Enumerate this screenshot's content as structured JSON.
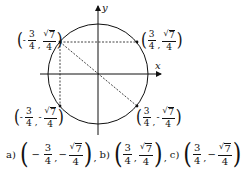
{
  "diagram": {
    "type": "unit-circle",
    "axes": {
      "x_label": "x",
      "y_label": "y"
    },
    "points": [
      {
        "id": "upper-left",
        "x": {
          "sign": "-",
          "num": "3",
          "den": "4"
        },
        "y": {
          "sign": "",
          "num": "7",
          "den": "4",
          "sqrt": true
        }
      },
      {
        "id": "upper-right",
        "x": {
          "sign": "",
          "num": "3",
          "den": "4"
        },
        "y": {
          "sign": "",
          "num": "7",
          "den": "4",
          "sqrt": true
        }
      },
      {
        "id": "lower-left",
        "x": {
          "sign": "-",
          "num": "3",
          "den": "4"
        },
        "y": {
          "sign": "-",
          "num": "7",
          "den": "4",
          "sqrt": true
        }
      },
      {
        "id": "lower-right",
        "x": {
          "sign": "",
          "num": "3",
          "den": "4"
        },
        "y": {
          "sign": "-",
          "num": "7",
          "den": "4",
          "sqrt": true
        }
      }
    ],
    "lines": [
      {
        "from": "upper-left",
        "to": "upper-right",
        "style": "dashed"
      },
      {
        "from": "upper-left",
        "to": "lower-left",
        "style": "dashed"
      },
      {
        "from": "upper-left",
        "to": "lower-right",
        "style": "dashed",
        "through": "origin"
      }
    ]
  },
  "answers": [
    {
      "tag": "a)",
      "x": {
        "sign": "−",
        "num": "3",
        "den": "4"
      },
      "y": {
        "sign": "−",
        "num": "7",
        "den": "4",
        "sqrt": true
      },
      "sep": ","
    },
    {
      "tag": "b)",
      "x": {
        "sign": "",
        "num": "3",
        "den": "4"
      },
      "y": {
        "sign": "",
        "num": "7",
        "den": "4",
        "sqrt": true
      },
      "sep": ","
    },
    {
      "tag": "c)",
      "x": {
        "sign": "",
        "num": "3",
        "den": "4"
      },
      "y": {
        "sign": "−",
        "num": "7",
        "den": "4",
        "sqrt": true
      },
      "sep": ""
    }
  ],
  "glyphs": {
    "open_paren": "(",
    "close_paren": ")",
    "comma": ",",
    "radical": "√"
  },
  "colors": {
    "ink": "#111111",
    "background": "#ffffff"
  }
}
